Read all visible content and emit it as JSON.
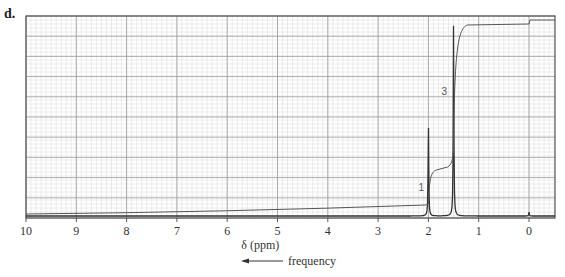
{
  "panel_label": "d.",
  "chart_data": {
    "type": "line",
    "title": "",
    "xlabel": "δ (ppm)",
    "direction_label": "frequency",
    "direction_arrow": "left",
    "xlim": [
      10,
      -0.5
    ],
    "x_ticks": [
      10,
      9,
      8,
      7,
      6,
      5,
      4,
      3,
      2,
      1,
      0
    ],
    "x_tick_labels": [
      "10",
      "9",
      "8",
      "7",
      "6",
      "5",
      "4",
      "3",
      "2",
      "1",
      "0"
    ],
    "grid": true,
    "series": [
      {
        "name": "spectrum",
        "peaks": [
          {
            "shift_ppm": 2.0,
            "relative_height": 0.48,
            "integration_label": "1"
          },
          {
            "shift_ppm": 1.5,
            "relative_height": 0.98,
            "integration_label": "3"
          },
          {
            "shift_ppm": 0.0,
            "relative_height": 0.02,
            "note": "TMS reference"
          }
        ]
      },
      {
        "name": "integration",
        "steps": [
          {
            "at_ppm": 2.0,
            "relative_rise": 1
          },
          {
            "at_ppm": 1.5,
            "relative_rise": 3
          }
        ]
      }
    ],
    "annotations": [
      {
        "text": "1",
        "near_ppm": 2.1
      },
      {
        "text": "3",
        "near_ppm": 1.6
      }
    ]
  },
  "colors": {
    "frame": "#555555",
    "grid_major": "#9a9a9a",
    "grid_minor": "#d8d8d8",
    "trace": "#333333"
  }
}
